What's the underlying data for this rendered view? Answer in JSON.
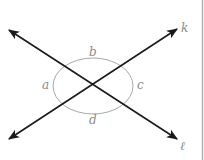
{
  "diagram": {
    "type": "intersecting-lines-angles",
    "lines": [
      {
        "name": "k",
        "label": "k"
      },
      {
        "name": "l",
        "label": "ℓ"
      }
    ],
    "angles": [
      {
        "name": "a",
        "label": "a"
      },
      {
        "name": "b",
        "label": "b"
      },
      {
        "name": "c",
        "label": "c"
      },
      {
        "name": "d",
        "label": "d"
      }
    ],
    "colors": {
      "line": "#1a1a1a",
      "arc": "#a8a8a8",
      "label": "#8a8a8a",
      "border": "#b0b0b0"
    }
  }
}
